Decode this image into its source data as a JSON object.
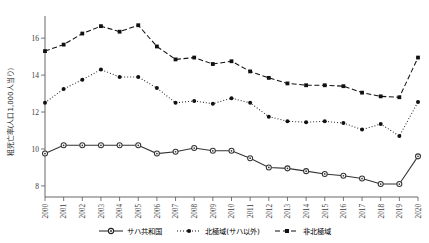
{
  "chart_data": {
    "type": "line",
    "title": "",
    "subtitle": "",
    "xlabel": "",
    "ylabel": "粗死亡率(人口1,000人当り)",
    "xlim": [
      2000,
      2020
    ],
    "ylim": [
      7.4,
      17.2
    ],
    "yticks": [
      8,
      10,
      12,
      14,
      16
    ],
    "ytick_labels": [
      "8",
      "10",
      "12",
      "14",
      "16"
    ],
    "grid": false,
    "legend_position": "bottom",
    "x": [
      2000,
      2001,
      2002,
      2003,
      2004,
      2005,
      2006,
      2007,
      2008,
      2009,
      2010,
      2011,
      2012,
      2013,
      2014,
      2015,
      2016,
      2017,
      2018,
      2019,
      2020
    ],
    "categories": [
      "2000",
      "2001",
      "2002",
      "2003",
      "2004",
      "2005",
      "2006",
      "2007",
      "2008",
      "2009",
      "2010",
      "2011",
      "2012",
      "2013",
      "2014",
      "2015",
      "2016",
      "2017",
      "2018",
      "2019",
      "2020"
    ],
    "series": [
      {
        "name": "サハ共和国",
        "marker": "open-circle",
        "linestyle": "solid",
        "color": "#333333",
        "values": [
          9.75,
          10.2,
          10.2,
          10.2,
          10.2,
          10.2,
          9.75,
          9.85,
          10.05,
          9.9,
          9.9,
          9.5,
          9.0,
          8.95,
          8.8,
          8.65,
          8.55,
          8.4,
          8.1,
          8.1,
          9.6
        ]
      },
      {
        "name": "北極域(サハ以外)",
        "marker": "filled-circle",
        "linestyle": "dotted",
        "color": "#111111",
        "values": [
          12.5,
          13.25,
          13.75,
          14.3,
          13.9,
          13.9,
          13.3,
          12.5,
          12.6,
          12.45,
          12.75,
          12.5,
          11.75,
          11.5,
          11.45,
          11.5,
          11.4,
          11.05,
          11.35,
          10.7,
          12.55
        ]
      },
      {
        "name": "非北極域",
        "marker": "filled-square",
        "linestyle": "dashed",
        "color": "#111111",
        "values": [
          15.3,
          15.65,
          16.25,
          16.65,
          16.35,
          16.7,
          15.55,
          14.85,
          14.95,
          14.6,
          14.75,
          14.2,
          13.85,
          13.55,
          13.45,
          13.45,
          13.4,
          13.05,
          12.85,
          12.8,
          14.95
        ]
      }
    ]
  },
  "legend": {
    "items": [
      {
        "label": "サハ共和国"
      },
      {
        "label": "北極域(サハ以外)"
      },
      {
        "label": "非北極域"
      }
    ]
  },
  "axes": {
    "y_title": "粗死亡率(人口1,000人当り)"
  }
}
